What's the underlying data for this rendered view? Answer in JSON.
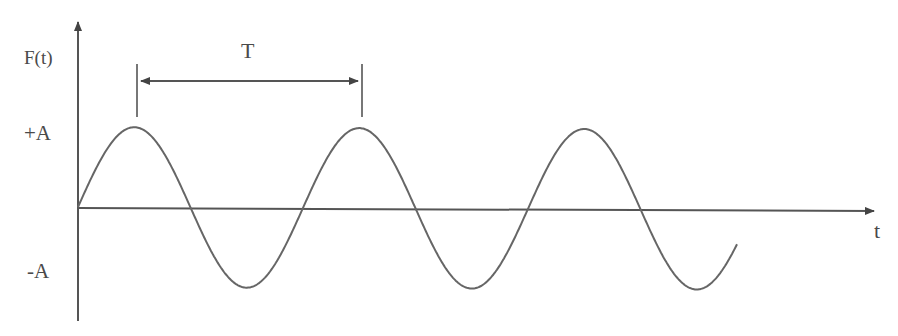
{
  "diagram": {
    "type": "sine-wave-period-diagram",
    "labels": {
      "y_axis": "F(t)",
      "x_axis": "t",
      "positive_amplitude": "+A",
      "negative_amplitude": "-A",
      "period": "T"
    },
    "geometry": {
      "origin": [
        78,
        208
      ],
      "y_axis_top": 17,
      "y_axis_bottom": 321,
      "x_axis_end": 876,
      "amplitude_px": 80,
      "period_px": 225,
      "wave_start_x": 78,
      "wave_end_x": 737,
      "period_bracket": {
        "x1": 137,
        "x2": 362,
        "y": 81,
        "tick_top": 64,
        "tick_bottom": 117
      }
    },
    "colors": {
      "stroke": "#555555",
      "text": "#4a4a4a",
      "background": "#ffffff"
    }
  }
}
